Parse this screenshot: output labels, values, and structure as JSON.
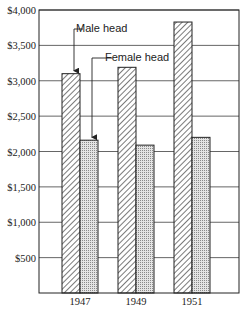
{
  "chart_data": {
    "type": "bar",
    "title": "",
    "xlabel": "",
    "ylabel": "",
    "categories": [
      "1947",
      "1949",
      "1951"
    ],
    "series": [
      {
        "name": "Male head",
        "values": [
          3100,
          3190,
          3830
        ],
        "pattern": "diagonal-hatch"
      },
      {
        "name": "Female head",
        "values": [
          2160,
          2090,
          2200
        ],
        "pattern": "dotted-stipple"
      }
    ],
    "ylim": [
      0,
      4000
    ],
    "yticks": [
      500,
      1000,
      1500,
      2000,
      2500,
      3000,
      3500,
      4000
    ],
    "ytick_labels": [
      "$500",
      "$1,000",
      "$1,500",
      "$2,000",
      "$2,500",
      "$3,000",
      "$3,500",
      "$4,000"
    ],
    "grid": "horizontal",
    "legend": "annotated arrows in plot area"
  },
  "colors": {
    "axis": "#222222",
    "grid": "#555555",
    "hatch": "#333333",
    "stipple": "#9a9a9a",
    "background": "#ffffff"
  }
}
